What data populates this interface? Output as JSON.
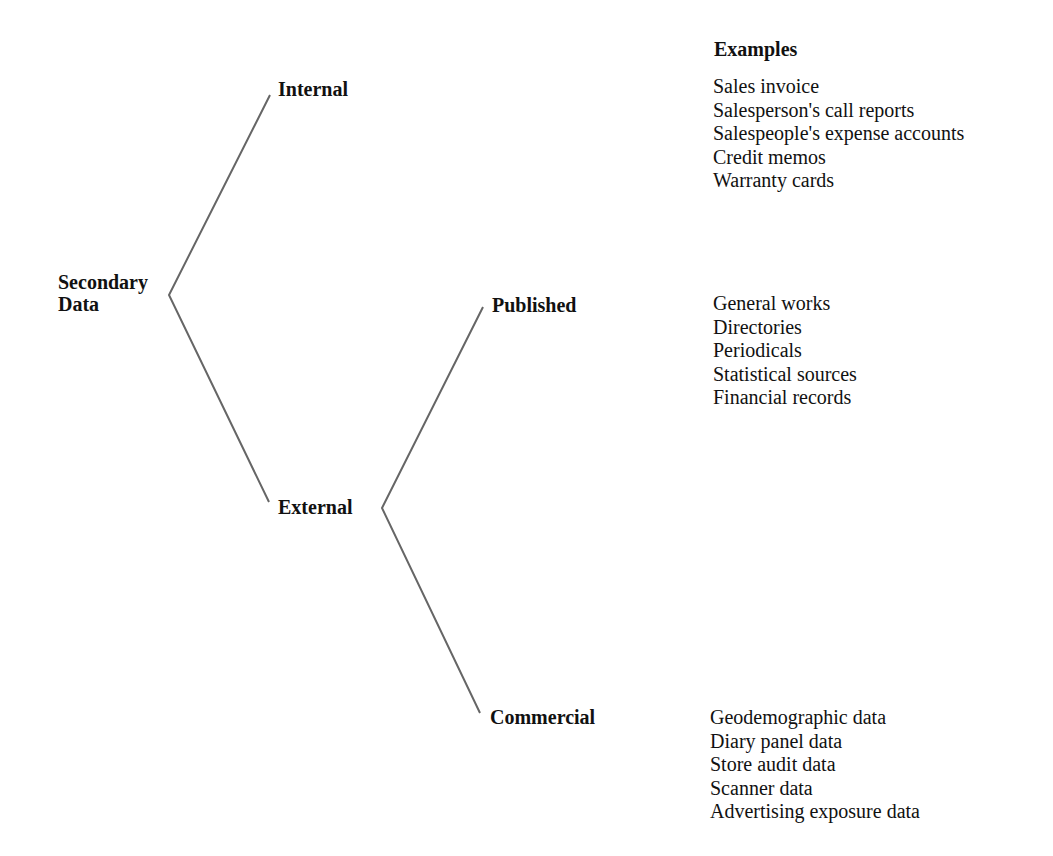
{
  "diagram": {
    "root": {
      "label_line1": "Secondary",
      "label_line2": "Data"
    },
    "internal": {
      "label": "Internal"
    },
    "external": {
      "label": "External"
    },
    "published": {
      "label": "Published"
    },
    "commercial": {
      "label": "Commercial"
    },
    "examples_title": "Examples",
    "examples": {
      "internal": [
        "Sales invoice",
        "Salesperson's call reports",
        "Salespeople's expense accounts",
        "Credit memos",
        "Warranty cards"
      ],
      "published": [
        "General works",
        "Directories",
        "Periodicals",
        "Statistical sources",
        "Financial records"
      ],
      "commercial": [
        "Geodemographic data",
        "Diary panel data",
        "Store audit data",
        "Scanner data",
        "Advertising exposure data"
      ]
    },
    "line_color": "#666666"
  }
}
